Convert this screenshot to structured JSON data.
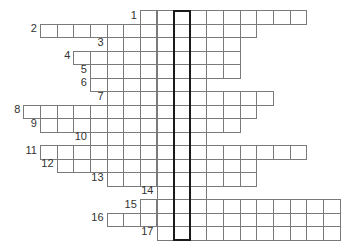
{
  "puzzle": {
    "type": "crossword",
    "grid": {
      "origin_x": 23.3,
      "origin_y": 10,
      "cell_width": 16.65,
      "cell_height": 13.5,
      "highlight_column": 9,
      "colors": {
        "cell_border": "#7a7a7a",
        "highlight_border": "#1a1a1a",
        "label": "#333333",
        "background": "#ffffff"
      }
    },
    "rows": [
      {
        "number": "1",
        "start_col": 7,
        "end_col": 16
      },
      {
        "number": "2",
        "start_col": 1,
        "end_col": 13
      },
      {
        "number": "3",
        "start_col": 5,
        "end_col": 12
      },
      {
        "number": "4",
        "start_col": 3,
        "end_col": 12
      },
      {
        "number": "5",
        "start_col": 4,
        "end_col": 12
      },
      {
        "number": "6",
        "start_col": 4,
        "end_col": 10
      },
      {
        "number": "7",
        "start_col": 5,
        "end_col": 14
      },
      {
        "number": "8",
        "start_col": 0,
        "end_col": 13
      },
      {
        "number": "9",
        "start_col": 1,
        "end_col": 12
      },
      {
        "number": "10",
        "start_col": 4,
        "end_col": 10
      },
      {
        "number": "11",
        "start_col": 1,
        "end_col": 16
      },
      {
        "number": "12",
        "start_col": 2,
        "end_col": 13
      },
      {
        "number": "13",
        "start_col": 5,
        "end_col": 13
      },
      {
        "number": "14",
        "start_col": 8,
        "end_col": 10
      },
      {
        "number": "15",
        "start_col": 7,
        "end_col": 18
      },
      {
        "number": "16",
        "start_col": 5,
        "end_col": 18
      },
      {
        "number": "17",
        "start_col": 8,
        "end_col": 18
      }
    ]
  }
}
